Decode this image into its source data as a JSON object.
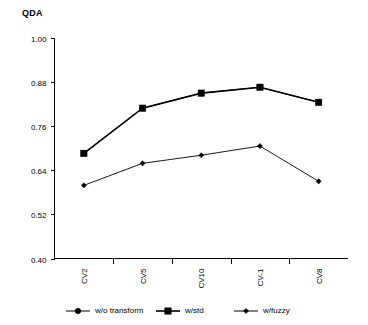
{
  "chart_data": {
    "type": "line",
    "title": "QDA",
    "xlabel": "",
    "ylabel": "",
    "categories": [
      "CV2",
      "CV5",
      "CV10",
      "CV-1",
      "CV8"
    ],
    "series": [
      {
        "name": "w/o transform",
        "marker": "circle",
        "values": [
          0.686,
          0.809,
          0.85,
          0.866,
          0.825
        ]
      },
      {
        "name": "w/std",
        "marker": "square",
        "values": [
          0.686,
          0.809,
          0.85,
          0.866,
          0.825
        ]
      },
      {
        "name": "w/fuzzy",
        "marker": "diamond",
        "values": [
          0.599,
          0.659,
          0.681,
          0.706,
          0.61
        ]
      }
    ],
    "ylim": [
      0.4,
      1.0
    ],
    "yticks": [
      1.0,
      0.88,
      0.76,
      0.64,
      0.52,
      0.4
    ],
    "ytick_labels": [
      "1.00",
      "0.88",
      "0.76",
      "0.64",
      "0.52",
      "0.40"
    ],
    "grid": false,
    "legend_position": "bottom",
    "xtick_rotation": 90,
    "colors": {
      "line": "#000000",
      "marker": "#000000",
      "background": "#ffffff"
    }
  },
  "axis": {
    "y_labels": [
      "1.00",
      "0.88",
      "0.76",
      "0.64",
      "0.52",
      "0.40"
    ],
    "x_labels": [
      "CV2",
      "CV5",
      "CV10",
      "CV-1",
      "CV8"
    ]
  },
  "legend": {
    "items": [
      {
        "label": "w/o transform",
        "marker": "circle-marker"
      },
      {
        "label": "w/std",
        "marker": "square-marker"
      },
      {
        "label": "w/fuzzy",
        "marker": "diamond-marker"
      }
    ]
  },
  "title": "QDA"
}
